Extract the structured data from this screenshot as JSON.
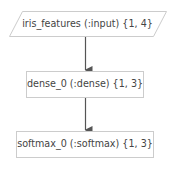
{
  "diagram": {
    "type": "flowchart",
    "direction": "top-to-bottom",
    "colors": {
      "node_fill": "#ffffff",
      "node_stroke": "#cccccc",
      "edge": "#555555",
      "text": "#444444"
    },
    "nodes": [
      {
        "id": "iris_features",
        "shape": "parallelogram",
        "label": "iris_features (:input) {1, 4}"
      },
      {
        "id": "dense_0",
        "shape": "rectangle",
        "label": "dense_0 (:dense) {1, 3}"
      },
      {
        "id": "softmax_0",
        "shape": "rectangle",
        "label": "softmax_0 (:softmax) {1, 3}"
      }
    ],
    "edges": [
      {
        "from": "iris_features",
        "to": "dense_0"
      },
      {
        "from": "dense_0",
        "to": "softmax_0"
      }
    ]
  }
}
